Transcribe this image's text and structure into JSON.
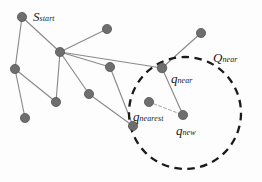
{
  "figure": {
    "width": 262,
    "height": 182,
    "background_color": "#fdfdfd",
    "node_color": "#6e6e6e",
    "node_stroke_color": "#4a4a4a",
    "edge_color": "#8a8a8a",
    "dashed_circle_color": "#1a1a1a",
    "dashed_connector_color": "#9a9a9a",
    "label_color": "#1a1a1a"
  },
  "labels": {
    "s_start": {
      "base": "S",
      "sub": "start"
    },
    "q_near_region": {
      "base": "Q",
      "sub": "near"
    },
    "q_near": {
      "base": "q",
      "sub": "near"
    },
    "q_nearest": {
      "base": "q",
      "sub": "nearest"
    },
    "q_new": {
      "base": "q",
      "sub": "new"
    }
  },
  "chart_data": {
    "type": "scatter",
    "xlabel": "",
    "ylabel": "",
    "xlim": [
      0,
      262
    ],
    "ylim": [
      0,
      182
    ],
    "grid": false,
    "legend": "none",
    "nodes": [
      {
        "id": "s_start",
        "x": 22,
        "y": 17,
        "r": 4.6,
        "label": "S_start"
      },
      {
        "id": "hub",
        "x": 60,
        "y": 52,
        "r": 4.6,
        "label": ""
      },
      {
        "id": "n_top",
        "x": 107,
        "y": 29,
        "r": 4.6,
        "label": ""
      },
      {
        "id": "n_left",
        "x": 15,
        "y": 69,
        "r": 4.6,
        "label": ""
      },
      {
        "id": "n_right",
        "x": 110,
        "y": 67,
        "r": 4.6,
        "label": ""
      },
      {
        "id": "n_mid",
        "x": 89,
        "y": 94,
        "r": 4.6,
        "label": ""
      },
      {
        "id": "n_lower",
        "x": 56,
        "y": 102,
        "r": 4.6,
        "label": ""
      },
      {
        "id": "n_bl",
        "x": 25,
        "y": 118,
        "r": 4.6,
        "label": ""
      },
      {
        "id": "n_bottom",
        "x": 133,
        "y": 126,
        "r": 4.6,
        "label": ""
      },
      {
        "id": "q_near",
        "x": 162,
        "y": 68,
        "r": 4.8,
        "label": "q_near"
      },
      {
        "id": "n_upright",
        "x": 201,
        "y": 33,
        "r": 4.6,
        "label": ""
      },
      {
        "id": "q_nearest",
        "x": 149,
        "y": 102,
        "r": 4.6,
        "label": "q_nearest"
      },
      {
        "id": "q_new",
        "x": 183,
        "y": 115,
        "r": 4.6,
        "label": "q_new"
      }
    ],
    "edges": [
      {
        "from": "s_start",
        "to": "hub",
        "style": "solid"
      },
      {
        "from": "s_start",
        "to": "n_left",
        "style": "solid"
      },
      {
        "from": "hub",
        "to": "n_top",
        "style": "solid"
      },
      {
        "from": "hub",
        "to": "n_right",
        "style": "solid"
      },
      {
        "from": "hub",
        "to": "n_mid",
        "style": "solid"
      },
      {
        "from": "hub",
        "to": "n_lower",
        "style": "solid"
      },
      {
        "from": "hub",
        "to": "q_near",
        "style": "solid"
      },
      {
        "from": "n_left",
        "to": "n_bl",
        "style": "solid"
      },
      {
        "from": "n_left",
        "to": "n_lower",
        "style": "solid"
      },
      {
        "from": "n_right",
        "to": "n_bottom",
        "style": "solid"
      },
      {
        "from": "n_mid",
        "to": "n_bottom",
        "style": "solid"
      },
      {
        "from": "q_near",
        "to": "n_upright",
        "style": "solid"
      },
      {
        "from": "q_near",
        "to": "q_new",
        "style": "solid"
      },
      {
        "from": "q_nearest",
        "to": "q_new",
        "style": "dashed-thin"
      }
    ],
    "circle": {
      "id": "q_near_region",
      "cx": 185,
      "cy": 113,
      "r": 56,
      "style": "dashed",
      "label": "Q_near"
    }
  }
}
